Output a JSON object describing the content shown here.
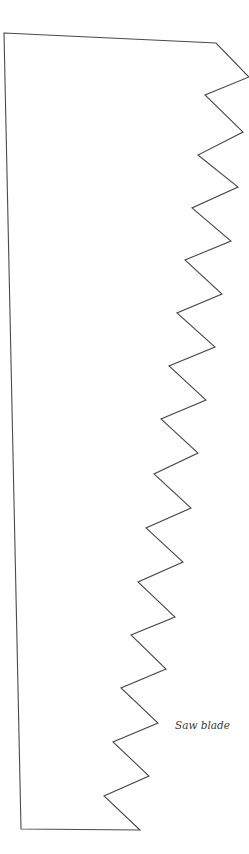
{
  "diagram": {
    "label": "Saw blade",
    "stroke_color": "#4a4a4a",
    "background_color": "#ffffff",
    "outline_points": [
      [
        4,
        33
      ],
      [
        216,
        43
      ],
      [
        249,
        77
      ],
      [
        205,
        95
      ],
      [
        243,
        132
      ],
      [
        198,
        155
      ],
      [
        238,
        187
      ],
      [
        192,
        208
      ],
      [
        231,
        241
      ],
      [
        185,
        260
      ],
      [
        222,
        294
      ],
      [
        177,
        313
      ],
      [
        215,
        347
      ],
      [
        169,
        366
      ],
      [
        206,
        400
      ],
      [
        161,
        419
      ],
      [
        198,
        453
      ],
      [
        154,
        474
      ],
      [
        191,
        508
      ],
      [
        146,
        528
      ],
      [
        183,
        562
      ],
      [
        138,
        582
      ],
      [
        175,
        617
      ],
      [
        131,
        635
      ],
      [
        166,
        669
      ],
      [
        121,
        688
      ],
      [
        158,
        723
      ],
      [
        113,
        742
      ],
      [
        149,
        776
      ],
      [
        104,
        796
      ],
      [
        140,
        830
      ],
      [
        21,
        829
      ]
    ],
    "teeth_count": 15
  }
}
